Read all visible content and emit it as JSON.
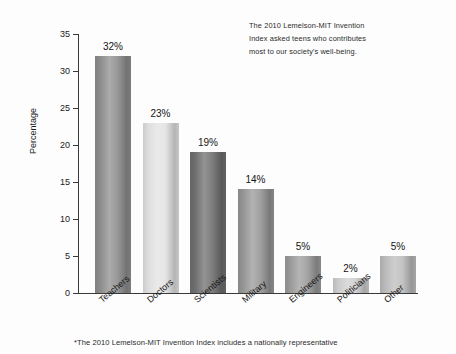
{
  "chart_data": {
    "type": "bar",
    "title": "",
    "subtitle": "",
    "xlabel": "",
    "ylabel": "Percentage",
    "ylim": [
      0,
      35
    ],
    "yticks": [
      0,
      5,
      10,
      15,
      20,
      25,
      30,
      35
    ],
    "ytick_labels": [
      "0",
      "5",
      "10",
      "15",
      "20",
      "25",
      "30",
      "35"
    ],
    "grid": false,
    "legend": null,
    "categories": [
      "Teachers",
      "Doctors",
      "Scientists",
      "Military",
      "Engineers",
      "Politicians",
      "Other"
    ],
    "values": [
      32,
      23,
      19,
      14,
      5,
      2,
      5
    ],
    "value_labels": [
      "32%",
      "23%",
      "19%",
      "14%",
      "5%",
      "2%",
      "5%"
    ],
    "bar_colors": [
      "#8e8e8e",
      "#e2e2e2",
      "#6f6f6f",
      "#979797",
      "#9b9b9b",
      "#cfcfcf",
      "#bdbdbd"
    ],
    "annotations": [
      "The 2010 Lemelson-MIT Invention",
      "Index asked teens who contributes",
      "most to our society's well-being."
    ],
    "footnote": "*The 2010 Lemelson-MIT Invention Index includes a nationally representative"
  },
  "style": {
    "background": "#fdfdfd",
    "axis_color": "#3a3a3a",
    "text_color": "#1b1b1b"
  }
}
